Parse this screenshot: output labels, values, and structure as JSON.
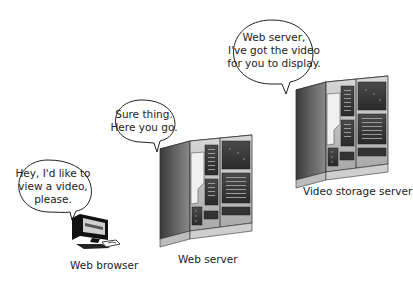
{
  "diagram": {
    "nodes": [
      {
        "id": "web-browser",
        "label": "Web browser",
        "icon": "computer-icon",
        "speech": [
          "Hey, I'd like to",
          "view a video,",
          "please."
        ]
      },
      {
        "id": "web-server",
        "label": "Web server",
        "icon": "server-cabinet-icon",
        "speech": [
          "Sure thing.",
          "Here you go."
        ]
      },
      {
        "id": "video-storage-server",
        "label": "Video storage server",
        "icon": "server-cabinet-icon",
        "speech": [
          "Web server,",
          "I've got the video",
          "for you to display."
        ]
      }
    ]
  }
}
